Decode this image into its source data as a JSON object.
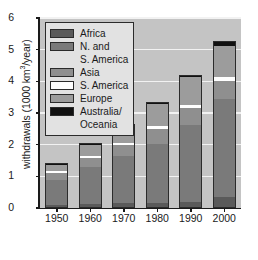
{
  "chart_data": {
    "type": "bar",
    "stacked": true,
    "title": "",
    "xlabel": "",
    "ylabel": "withdrawals (1000 km3/year)",
    "ylabel_prefix": "withdrawals (1000 km",
    "ylabel_exponent": "3",
    "ylabel_suffix": "/year)",
    "categories": [
      "1950",
      "1960",
      "1970",
      "1980",
      "1990",
      "2000"
    ],
    "ylim": [
      0,
      6
    ],
    "yticks": [
      "0",
      "1",
      "2",
      "3",
      "4",
      "5",
      "6"
    ],
    "grid": true,
    "legend_position": "upper-left",
    "series": [
      {
        "name": "Africa",
        "color": "#5a5a5a",
        "values": [
          0.05,
          0.09,
          0.12,
          0.14,
          0.17,
          0.32
        ]
      },
      {
        "name": "N. and S. America",
        "color": "#7a7a7a",
        "values": [
          0.8,
          1.16,
          1.48,
          1.86,
          2.43,
          3.1
        ]
      },
      {
        "name": "Asia",
        "color": "#8f8f8f",
        "values": [
          0.23,
          0.3,
          0.35,
          0.47,
          0.53,
          0.57
        ]
      },
      {
        "name": "S. America",
        "color": "#ffffff",
        "values": [
          0.05,
          0.07,
          0.08,
          0.08,
          0.09,
          0.11
        ]
      },
      {
        "name": "Europe",
        "color": "#9c9c9c",
        "values": [
          0.19,
          0.33,
          0.51,
          0.7,
          0.88,
          1.0
        ]
      },
      {
        "name": "Australia/ Oceania",
        "color": "#111111",
        "values": [
          0.03,
          0.05,
          0.06,
          0.05,
          0.05,
          0.1
        ]
      }
    ],
    "totals": [
      1.35,
      2.0,
      2.6,
      3.3,
      4.15,
      5.2
    ]
  },
  "legend": {
    "entries": [
      {
        "label": "Africa",
        "label2": ""
      },
      {
        "label": "N. and",
        "label2": "S. America"
      },
      {
        "label": "Asia",
        "label2": ""
      },
      {
        "label": "S. America",
        "label2": ""
      },
      {
        "label": "Europe",
        "label2": ""
      },
      {
        "label": "Australia/",
        "label2": "Oceania"
      }
    ]
  }
}
